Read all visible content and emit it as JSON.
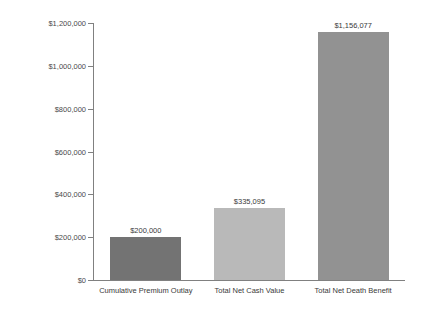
{
  "chart_data": {
    "type": "bar",
    "title": "",
    "xlabel": "",
    "ylabel": "",
    "grid": false,
    "legend": "none",
    "ylim": [
      0,
      1200000
    ],
    "ytick_labels": [
      "$1,200,000",
      "$1,000,000",
      "$800,000",
      "$600,000",
      "$400,000",
      "$200,000",
      "$0"
    ],
    "ytick_values": [
      1200000,
      1000000,
      800000,
      600000,
      400000,
      200000,
      0
    ],
    "categories": [
      "Cumulative Premium Outlay",
      "Total Net Cash Value",
      "Total Net Death Benefit"
    ],
    "values": [
      200000,
      335095,
      1156077
    ],
    "value_labels": [
      "$200,000",
      "$335,095",
      "$1,156,077"
    ],
    "bar_colors": [
      "#737373",
      "#b9b9b9",
      "#929292"
    ]
  },
  "axis": {
    "line_color": "#808080"
  }
}
